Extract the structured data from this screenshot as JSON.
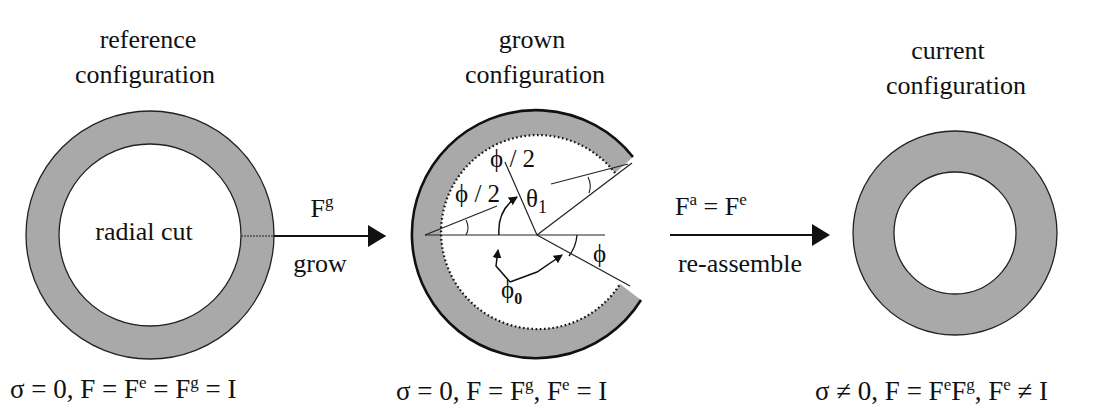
{
  "colors": {
    "ring_fill": "#a9a9a9",
    "stroke": "#111111",
    "background": "#ffffff"
  },
  "panels": {
    "reference": {
      "title_line1": "reference",
      "title_line2": "configuration",
      "inner_label": "radial cut",
      "equation": {
        "p1": "σ = 0, F = F",
        "sup1": "e",
        "p2": " = F",
        "sup2": "g",
        "p3": " = I"
      }
    },
    "grown": {
      "title_line1": "grown",
      "title_line2": "configuration",
      "labels": {
        "half_phi_left": "ϕ / 2",
        "half_phi_right": "ϕ / 2",
        "theta": "θ",
        "theta_sub": "1",
        "phi": "ϕ",
        "phi0": "ϕ",
        "phi0_sub": "0"
      },
      "equation": {
        "p1": "σ = 0, F = F",
        "sup1": "g",
        "p2": ", F",
        "sup2": "e",
        "p3": " = I"
      }
    },
    "current": {
      "title_line1": "current",
      "title_line2": "configuration",
      "equation": {
        "p1": "σ ≠ 0, F = F",
        "sup1": "e",
        "p2": "F",
        "sup2": "g",
        "p3": ", F",
        "sup3": "e",
        "p4": " ≠ I"
      }
    }
  },
  "arrows": {
    "grow": {
      "top_base": "F",
      "top_sup": "g",
      "bottom": "grow"
    },
    "reassemble": {
      "top_base1": "F",
      "top_sup1": "a",
      "top_mid": " = F",
      "top_sup2": "e",
      "bottom": "re-assemble"
    }
  }
}
